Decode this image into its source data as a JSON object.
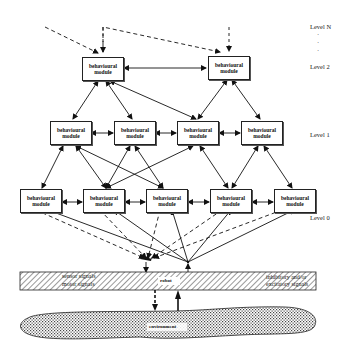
{
  "levels": {
    "n": "Level N",
    "dots": [
      "·",
      "·",
      "·"
    ],
    "l2": "Level 2",
    "l1": "Level 1",
    "l0": "Level 0"
  },
  "module_label": [
    "behavioural",
    "module"
  ],
  "modules": {
    "level2": [
      {
        "id": "L2a",
        "line1": "behavioural",
        "line2": "module"
      },
      {
        "id": "L2b",
        "line1": "behavioural",
        "line2": "module"
      }
    ],
    "level1": [
      {
        "id": "L1a",
        "line1": "behavioural",
        "line2": "module"
      },
      {
        "id": "L1b",
        "line1": "behavioural",
        "line2": "module"
      },
      {
        "id": "L1c",
        "line1": "behavioural",
        "line2": "module"
      },
      {
        "id": "L1d",
        "line1": "behavioural",
        "line2": "module"
      }
    ],
    "level0": [
      {
        "id": "L0a",
        "line1": "behavioural",
        "line2": "module"
      },
      {
        "id": "L0b",
        "line1": "behavioural",
        "line2": "module"
      },
      {
        "id": "L0c",
        "line1": "behavioural",
        "line2": "module"
      },
      {
        "id": "L0d",
        "line1": "behavioural",
        "line2": "module"
      },
      {
        "id": "L0e",
        "line1": "behavioural",
        "line2": "module"
      }
    ]
  },
  "legend": {
    "sensor": "sensor signals",
    "motor": "motor signals",
    "inhib_line1": "inhibitory and/or",
    "inhib_line2": "excitatory signals"
  },
  "robot_label": "robot",
  "environment_label": "environment"
}
